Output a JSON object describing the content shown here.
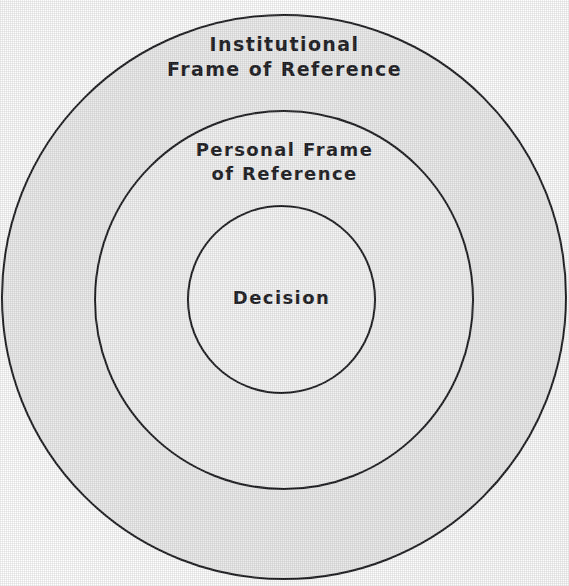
{
  "diagram": {
    "type": "concentric-circles",
    "background_color": "#ffffff",
    "stroke_color": "#17171a",
    "zones": [
      {
        "id": "institutional",
        "label": "Institutional\nFrame of Reference",
        "label_line_1": "Institutional",
        "label_line_2": "Frame of Reference",
        "level": 1,
        "fill_color": "#ededed",
        "center_x": 284,
        "center_y": 297,
        "radius": 283
      },
      {
        "id": "personal",
        "label": "Personal Frame\nof Reference",
        "label_line_1": "Personal Frame",
        "label_line_2": "of Reference",
        "level": 2,
        "fill_color": "#f3f3f3",
        "center_x": 284,
        "center_y": 300,
        "radius": 190
      },
      {
        "id": "decision",
        "label": "Decision",
        "label_line_1": "Decision",
        "label_line_2": "",
        "level": 3,
        "fill_color": "#f7f7f7",
        "center_x": 281,
        "center_y": 299,
        "radius": 94
      }
    ]
  },
  "chart_data": {
    "type": "diagram",
    "subtype": "concentric-circles",
    "categories": [
      "Institutional Frame of Reference",
      "Personal Frame of Reference",
      "Decision"
    ],
    "values": [
      283,
      190,
      94
    ],
    "ylabel": "Radius (px)",
    "xlabel": "",
    "legend": [],
    "grid": false
  }
}
